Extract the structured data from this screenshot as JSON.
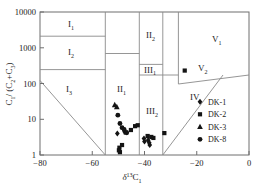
{
  "chart_data": {
    "type": "scatter",
    "title": "",
    "xlabel": "δ¹³C₁",
    "ylabel": "C₁/(C₂+C₃)",
    "xlabel_main": "δ",
    "xlabel_sup": "13",
    "xlabel_sym": "C",
    "xlabel_sub": "1",
    "xlim": [
      -80,
      0
    ],
    "ylim": [
      1,
      10000
    ],
    "yscale": "log",
    "xscale": "linear",
    "grid": false,
    "xticks": [
      -80,
      -60,
      -40,
      -20,
      0
    ],
    "xticklabels": [
      "−80",
      "−60",
      "−40",
      "−20",
      "0"
    ],
    "yticks": [
      1,
      10,
      100,
      1000,
      10000
    ],
    "yticklabels": [
      "1",
      "10",
      "100",
      "1000",
      "10000"
    ],
    "legend_position": "lower-right",
    "legend": [
      {
        "name": "DK-1",
        "marker": "diamond"
      },
      {
        "name": "DK-2",
        "marker": "square"
      },
      {
        "name": "DK-3",
        "marker": "triangle"
      },
      {
        "name": "DK-8",
        "marker": "circle"
      }
    ],
    "fields": [
      {
        "label": "I",
        "sub": "1"
      },
      {
        "label": "I",
        "sub": "2"
      },
      {
        "label": "I",
        "sub": "3"
      },
      {
        "label": "II",
        "sub": "1"
      },
      {
        "label": "II",
        "sub": "2"
      },
      {
        "label": "III",
        "sub": "1"
      },
      {
        "label": "III",
        "sub": "2"
      },
      {
        "label": "IV",
        "sub": ""
      },
      {
        "label": "V",
        "sub": "1"
      },
      {
        "label": "V",
        "sub": "2"
      }
    ],
    "series": [
      {
        "name": "DK-1",
        "marker": "diamond",
        "points": [
          {
            "x": -50.4,
            "y": 4.0
          },
          {
            "x": -47.6,
            "y": 4.5
          },
          {
            "x": -38.6,
            "y": 2.6
          },
          {
            "x": -38.2,
            "y": 2.2
          },
          {
            "x": -38.0,
            "y": 1.9
          },
          {
            "x": -40.2,
            "y": 2.9
          },
          {
            "x": -40.0,
            "y": 2.4
          }
        ]
      },
      {
        "name": "DK-2",
        "marker": "square",
        "points": [
          {
            "x": -49.6,
            "y": 1.6
          },
          {
            "x": -49.4,
            "y": 1.2
          },
          {
            "x": -48.6,
            "y": 1.9
          },
          {
            "x": -47.2,
            "y": 4.3
          },
          {
            "x": -45.2,
            "y": 5.0
          },
          {
            "x": -43.6,
            "y": 6.4
          },
          {
            "x": -42.6,
            "y": 6.8
          },
          {
            "x": -38.8,
            "y": 3.4
          },
          {
            "x": -37.4,
            "y": 3.2
          },
          {
            "x": -36.6,
            "y": 3.0
          },
          {
            "x": -32.4,
            "y": 4.1
          },
          {
            "x": -24.6,
            "y": 230.0
          },
          {
            "x": -49.8,
            "y": 1.35
          }
        ]
      },
      {
        "name": "DK-3",
        "marker": "triangle",
        "points": [
          {
            "x": -51.4,
            "y": 25.0
          },
          {
            "x": -50.6,
            "y": 22.0
          }
        ]
      },
      {
        "name": "DK-8",
        "marker": "circle",
        "points": [
          {
            "x": -50.2,
            "y": 13.0
          },
          {
            "x": -49.4,
            "y": 7.6
          },
          {
            "x": -48.6,
            "y": 5.8
          },
          {
            "x": -47.8,
            "y": 5.2
          },
          {
            "x": -46.8,
            "y": 4.2
          }
        ]
      }
    ]
  }
}
